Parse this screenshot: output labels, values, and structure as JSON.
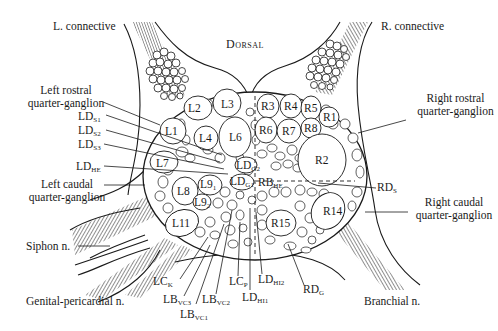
{
  "diagram": {
    "orientation_label": "Dorsal",
    "connectives": [
      {
        "id": "left_connective",
        "label": "L. connective"
      },
      {
        "id": "right_connective",
        "label": "R. connective"
      }
    ],
    "nerves": [
      {
        "id": "siphon",
        "label": "Siphon n."
      },
      {
        "id": "genital_pericardial",
        "label": "Genital-pericardial n."
      },
      {
        "id": "branchial",
        "label": "Branchial n."
      }
    ],
    "regions": {
      "left_rostral": {
        "line1": "Left rostral",
        "line2": "quarter-ganglion"
      },
      "right_rostral": {
        "line1": "Right rostral",
        "line2": "quarter-ganglion"
      },
      "left_caudal": {
        "line1": "Left caudal",
        "line2": "quarter-ganglion"
      },
      "right_caudal": {
        "line1": "Right caudal",
        "line2": "quarter-ganglion"
      }
    },
    "left_cells": [
      "L1",
      "L2",
      "L3",
      "L4",
      "L6",
      "L7",
      "L8",
      "L11"
    ],
    "right_cells": [
      "R1",
      "R2",
      "R3",
      "R4",
      "R5",
      "R6",
      "R7",
      "R8",
      "R14",
      "R15"
    ],
    "l9": {
      "base": "L9",
      "sub1": "1",
      "sub2": "2"
    },
    "center_cells": {
      "ldg2": {
        "base": "LD",
        "sub": "G2"
      },
      "ldg1": {
        "base": "LD",
        "sub": "G1"
      },
      "rbhe": {
        "base": "RB",
        "sub": "HE"
      }
    },
    "side_labels": {
      "lds1": {
        "base": "LD",
        "sub": "S1"
      },
      "lds2": {
        "base": "LD",
        "sub": "S2"
      },
      "lds3": {
        "base": "LD",
        "sub": "S3"
      },
      "ldhe": {
        "base": "LD",
        "sub": "HE"
      },
      "rds": {
        "base": "RD",
        "sub": "S"
      }
    },
    "bottom_labels": {
      "lck": {
        "base": "LC",
        "sub": "K"
      },
      "lbvc3": {
        "base": "LB",
        "sub": "VC3"
      },
      "lbvc1": {
        "base": "LB",
        "sub": "VC1"
      },
      "lbvc2": {
        "base": "LB",
        "sub": "VC2"
      },
      "lcp": {
        "base": "LC",
        "sub": "P"
      },
      "ldhi1": {
        "base": "LD",
        "sub": "HI1"
      },
      "ldhi2": {
        "base": "LD",
        "sub": "HI2"
      },
      "rdg": {
        "base": "RD",
        "sub": "G"
      }
    }
  }
}
